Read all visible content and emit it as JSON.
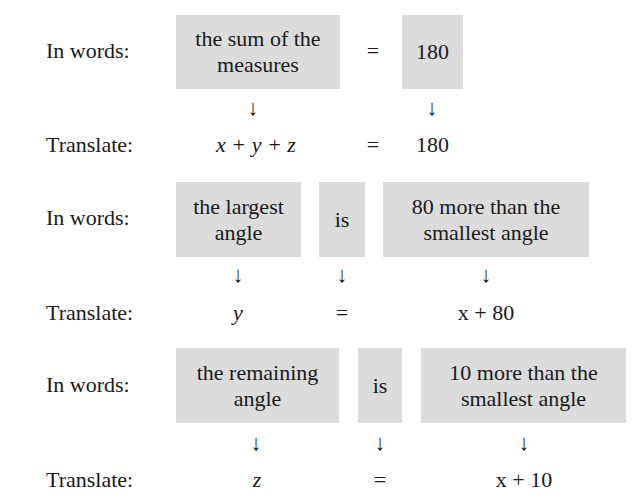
{
  "rows": [
    {
      "words_label": "In words:",
      "translate_label": "Translate:",
      "boxes": [
        "the sum of the measures",
        "=",
        "180"
      ],
      "translations": [
        "x + y + z",
        "=",
        "180"
      ]
    },
    {
      "words_label": "In words:",
      "translate_label": "Translate:",
      "boxes": [
        "the largest angle",
        "is",
        "80 more than the smallest angle"
      ],
      "translations": [
        "y",
        "=",
        "x + 80"
      ]
    },
    {
      "words_label": "In words:",
      "translate_label": "Translate:",
      "boxes": [
        "the remaining angle",
        "is",
        "10 more than the smallest angle"
      ],
      "translations": [
        "z",
        "=",
        "x + 10"
      ]
    }
  ],
  "arrow_glyph": "↓",
  "box_color": "#dcdcdc"
}
